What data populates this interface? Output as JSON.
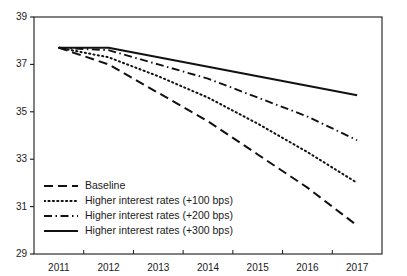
{
  "chart_data": {
    "type": "line",
    "title": "",
    "xlabel": "",
    "ylabel": "",
    "x": [
      2011,
      2012,
      2013,
      2014,
      2015,
      2016,
      2017
    ],
    "xlim": [
      2011,
      2017
    ],
    "ylim": [
      29,
      39
    ],
    "ytick_values": [
      29,
      31,
      33,
      35,
      37,
      39
    ],
    "xtick_labels": [
      "2011",
      "2012",
      "2013",
      "2014",
      "2015",
      "2016",
      "2017"
    ],
    "ytick_labels": [
      "29",
      "31",
      "33",
      "35",
      "37",
      "39"
    ],
    "grid": false,
    "legend_position": "lower-left",
    "series": [
      {
        "name": "Baseline",
        "style": "dashed",
        "color": "#111111",
        "values": [
          37.7,
          37.0,
          35.8,
          34.6,
          33.2,
          31.8,
          30.2
        ]
      },
      {
        "name": "Higher interest rates (+100 bps)",
        "style": "dotted",
        "color": "#111111",
        "values": [
          37.7,
          37.3,
          36.5,
          35.6,
          34.5,
          33.3,
          32.0
        ]
      },
      {
        "name": "Higher interest rates (+200 bps)",
        "style": "dash-dot",
        "color": "#111111",
        "values": [
          37.7,
          37.6,
          37.0,
          36.4,
          35.6,
          34.8,
          33.8
        ]
      },
      {
        "name": "Higher interest rates (+300 bps)",
        "style": "solid",
        "color": "#111111",
        "values": [
          37.7,
          37.7,
          37.3,
          36.9,
          36.5,
          36.1,
          35.7
        ]
      }
    ]
  },
  "legend": {
    "items": [
      {
        "label": "Baseline",
        "sample": "dashed-line-icon"
      },
      {
        "label": "Higher interest rates (+100 bps)",
        "sample": "dotted-line-icon"
      },
      {
        "label": "Higher interest rates (+200 bps)",
        "sample": "dash-dot-line-icon"
      },
      {
        "label": "Higher interest rates (+300 bps)",
        "sample": "solid-line-icon"
      }
    ]
  },
  "axes": {
    "frame_color": "#1a1a1a"
  }
}
